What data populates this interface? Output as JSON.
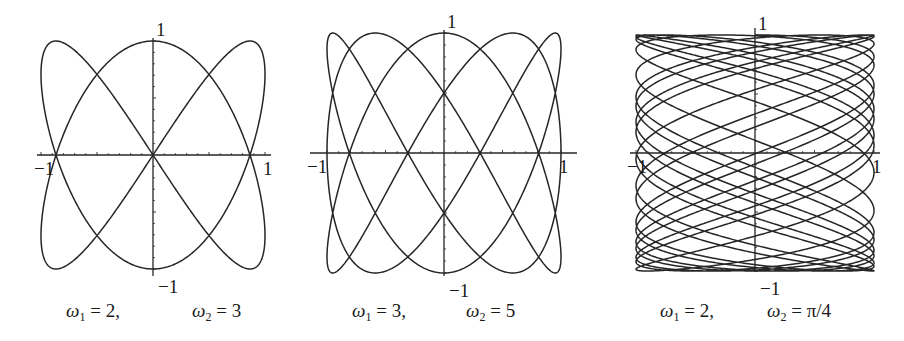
{
  "chart_data": [
    {
      "type": "line",
      "title": "",
      "parametric": {
        "x": "sin(w1*t)",
        "y": "cos(w2*t)",
        "w1": 2,
        "w2": 3,
        "t_range": [
          0,
          6.2832
        ]
      },
      "xlabel": "",
      "ylabel": "",
      "xlim": [
        -1,
        1
      ],
      "ylim": [
        -1,
        1
      ],
      "x_tick_labels": [
        "-1",
        "1"
      ],
      "y_tick_labels": [
        "1",
        "-1"
      ],
      "grid": false,
      "legend": null,
      "caption": {
        "w1_label": "ω",
        "w1_sub": "1",
        "w1_value": "= 2,",
        "w2_label": "ω",
        "w2_sub": "2",
        "w2_value": "= 3"
      },
      "layout": {
        "cx": 153,
        "cy": 155,
        "sx": 112,
        "sy": 114,
        "axis_x": [
          37,
          271
        ],
        "axis_y": [
          38,
          276
        ]
      }
    },
    {
      "type": "line",
      "title": "",
      "parametric": {
        "x": "sin(w1*t)",
        "y": "cos(w2*t)",
        "w1": 3,
        "w2": 5,
        "t_range": [
          0,
          6.2832
        ]
      },
      "xlabel": "",
      "ylabel": "",
      "xlim": [
        -1,
        1
      ],
      "ylim": [
        -1,
        1
      ],
      "x_tick_labels": [
        "-1",
        "1"
      ],
      "y_tick_labels": [
        "1",
        "-1"
      ],
      "grid": false,
      "legend": null,
      "caption": {
        "w1_label": "ω",
        "w1_sub": "1",
        "w1_value": "= 3,",
        "w2_label": "ω",
        "w2_sub": "2",
        "w2_value": "= 5"
      },
      "layout": {
        "cx": 444,
        "cy": 153,
        "sx": 117,
        "sy": 120,
        "axis_x": [
          310,
          577
        ],
        "axis_y": [
          30,
          276
        ]
      }
    },
    {
      "type": "line",
      "title": "",
      "parametric": {
        "x": "sin(w1*t)",
        "y": "cos(w2*t)",
        "w1": 2,
        "w2": "π/4",
        "w2_numeric": 0.785398,
        "t_range": [
          0,
          62
        ]
      },
      "xlabel": "",
      "ylabel": "",
      "xlim": [
        -1,
        1
      ],
      "ylim": [
        -1,
        1
      ],
      "x_tick_labels": [
        "-1",
        "1"
      ],
      "y_tick_labels": [
        "1",
        "-1"
      ],
      "grid": false,
      "legend": null,
      "caption": {
        "w1_label": "ω",
        "w1_sub": "1",
        "w1_value": "= 2,",
        "w2_label": "ω",
        "w2_sub": "2",
        "w2_value": "= π/4"
      },
      "layout": {
        "cx": 755,
        "cy": 153,
        "sx": 119,
        "sy": 118,
        "axis_x": [
          630,
          880
        ],
        "axis_y": [
          28,
          272
        ]
      }
    }
  ],
  "captions": [
    {
      "left_x": 66,
      "right_x": 192
    },
    {
      "left_x": 352,
      "right_x": 466
    },
    {
      "left_x": 660,
      "right_x": 767
    }
  ],
  "labels": {
    "one": "1",
    "minus_one": "−1"
  },
  "colors": {
    "curve": "#262626",
    "axis": "#262626",
    "background": "#ffffff"
  }
}
